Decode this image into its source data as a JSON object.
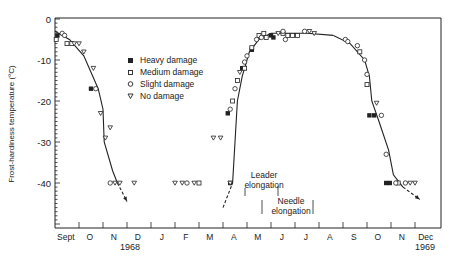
{
  "chart_data": {
    "type": "scatter",
    "title": "",
    "xlabel": "",
    "ylabel": "Frost-hardiness temperature (°C)",
    "ylim": [
      -50,
      0
    ],
    "yticks": [
      0,
      -10,
      -20,
      -30,
      -40
    ],
    "ytick_labels": [
      "0",
      "-10",
      "-20",
      "-30",
      "-40"
    ],
    "x_unit": "months from 1 Sept 1968",
    "xlim": [
      0,
      16
    ],
    "x_month_labels": [
      "Sept",
      "O",
      "N",
      "D",
      "J",
      "F",
      "M",
      "A",
      "M",
      "J",
      "J",
      "A",
      "S",
      "O",
      "N",
      "Dec"
    ],
    "year_labels": [
      {
        "text": "1968",
        "x": 3.5
      },
      {
        "text": "1969",
        "x": 4.5
      },
      {
        "text": "1969",
        "x": 15.5
      }
    ],
    "grid": false,
    "legend_position": "upper-left-inside",
    "legend": [
      {
        "label": "Heavy damage",
        "marker": "filled-square"
      },
      {
        "label": "Medium damage",
        "marker": "open-square"
      },
      {
        "label": "Slight damage",
        "marker": "open-circle"
      },
      {
        "label": "No damage",
        "marker": "open-triangle-down"
      }
    ],
    "series": [
      {
        "name": "Heavy damage",
        "marker": "filled-square",
        "points": [
          [
            0.1,
            -4
          ],
          [
            1.5,
            -17
          ],
          [
            7.2,
            -23
          ],
          [
            7.8,
            -12
          ],
          [
            8.2,
            -7.5
          ],
          [
            9.0,
            -4
          ],
          [
            9.1,
            -4.5
          ],
          [
            13.1,
            -23.5
          ],
          [
            13.3,
            -23.5
          ],
          [
            13.8,
            -40
          ],
          [
            13.95,
            -40
          ],
          [
            7.3,
            -40
          ]
        ]
      },
      {
        "name": "Medium damage",
        "marker": "open-square",
        "points": [
          [
            0.05,
            -5
          ],
          [
            0.5,
            -6
          ],
          [
            0.7,
            -6
          ],
          [
            7.4,
            -20
          ],
          [
            7.6,
            -15
          ],
          [
            7.9,
            -12
          ],
          [
            8.2,
            -7
          ],
          [
            8.5,
            -4
          ],
          [
            8.7,
            -3.5
          ],
          [
            8.8,
            -4.5
          ],
          [
            9.5,
            -3.5
          ],
          [
            9.7,
            -4
          ],
          [
            9.9,
            -4
          ],
          [
            10.1,
            -4
          ],
          [
            12.7,
            -8
          ],
          [
            13.0,
            -16
          ],
          [
            14.3,
            -40
          ],
          [
            6.0,
            -40
          ]
        ]
      },
      {
        "name": "Slight damage",
        "marker": "open-circle",
        "points": [
          [
            0.3,
            -3.5
          ],
          [
            0.4,
            -4
          ],
          [
            1.7,
            -17
          ],
          [
            7.3,
            -22
          ],
          [
            7.5,
            -17
          ],
          [
            7.9,
            -10.5
          ],
          [
            8.0,
            -9
          ],
          [
            8.4,
            -5
          ],
          [
            8.6,
            -4.5
          ],
          [
            9.5,
            -3
          ],
          [
            9.6,
            -5
          ],
          [
            10.4,
            -3
          ],
          [
            12.1,
            -5
          ],
          [
            12.2,
            -5.5
          ],
          [
            12.6,
            -6.5
          ],
          [
            12.9,
            -10
          ],
          [
            13.0,
            -13.5
          ],
          [
            13.6,
            -23.5
          ],
          [
            13.8,
            -33
          ],
          [
            14.2,
            -40
          ],
          [
            14.6,
            -40
          ],
          [
            2.3,
            -40
          ],
          [
            5.5,
            -40
          ]
        ]
      },
      {
        "name": "No damage",
        "marker": "open-triangle-down",
        "points": [
          [
            0.8,
            -6
          ],
          [
            1.0,
            -6
          ],
          [
            1.2,
            -8
          ],
          [
            1.6,
            -12
          ],
          [
            1.9,
            -23
          ],
          [
            2.1,
            -29
          ],
          [
            2.3,
            -26.5
          ],
          [
            2.5,
            -40
          ],
          [
            2.7,
            -40
          ],
          [
            3.3,
            -40
          ],
          [
            5.0,
            -40
          ],
          [
            5.3,
            -40
          ],
          [
            5.8,
            -40
          ],
          [
            6.6,
            -29
          ],
          [
            6.9,
            -29
          ],
          [
            7.3,
            -40
          ],
          [
            7.7,
            -13
          ],
          [
            9.3,
            -3.5
          ],
          [
            10.6,
            -3
          ],
          [
            10.8,
            -3.5
          ],
          [
            13.4,
            -20.5
          ],
          [
            14.8,
            -40
          ],
          [
            15.0,
            -40
          ]
        ]
      }
    ],
    "fitted_curves": [
      {
        "name": "1968 autumn hardening",
        "points": [
          [
            0,
            -3
          ],
          [
            0.6,
            -5
          ],
          [
            1.2,
            -9
          ],
          [
            1.8,
            -17
          ],
          [
            2.0,
            -22
          ],
          [
            2.05,
            -30
          ],
          [
            2.4,
            -37
          ],
          [
            2.6,
            -40
          ]
        ],
        "extension_dashed": [
          [
            2.6,
            -40
          ],
          [
            3.0,
            -44.5
          ]
        ]
      },
      {
        "name": "1969 spring dehardening",
        "points": [
          [
            7.4,
            -40
          ],
          [
            7.5,
            -30
          ],
          [
            7.6,
            -20
          ],
          [
            7.8,
            -14
          ],
          [
            8.1,
            -8
          ],
          [
            8.5,
            -5
          ],
          [
            9.0,
            -3.5
          ]
        ],
        "extension_dashed": [
          [
            7.0,
            -46
          ],
          [
            7.4,
            -40
          ]
        ]
      },
      {
        "name": "1969 summer plateau",
        "points": [
          [
            9.0,
            -3.5
          ],
          [
            10.5,
            -3.5
          ],
          [
            11.6,
            -4
          ]
        ]
      },
      {
        "name": "1969 autumn hardening",
        "points": [
          [
            11.6,
            -4
          ],
          [
            12.3,
            -6
          ],
          [
            12.9,
            -10
          ],
          [
            13.1,
            -14
          ],
          [
            13.2,
            -20
          ],
          [
            13.5,
            -25
          ],
          [
            13.9,
            -32
          ],
          [
            14.1,
            -38
          ],
          [
            14.5,
            -41
          ]
        ],
        "extension_dashed": [
          [
            14.5,
            -41
          ],
          [
            15.2,
            -44
          ]
        ]
      }
    ],
    "annotations": [
      {
        "text": "Leader elongation",
        "x_range": [
          8.0,
          9.8
        ],
        "y": -40
      },
      {
        "text": "Needle elongation",
        "x_range": [
          9.5,
          11.3
        ],
        "y": -44
      }
    ]
  },
  "axis": {
    "ylabel": "Frost-hardiness temperature (°C)",
    "yticks": [
      "0",
      "-10",
      "-20",
      "-30",
      "-40"
    ],
    "months": [
      "Sept",
      "O",
      "N",
      "D",
      "J",
      "F",
      "M",
      "A",
      "M",
      "J",
      "J",
      "A",
      "S",
      "O",
      "N",
      "Dec"
    ],
    "year_1968": "1968",
    "year_1969a": "1969",
    "year_1969b": "1969"
  },
  "legend": {
    "heavy": "Heavy damage",
    "medium": "Medium damage",
    "slight": "Slight damage",
    "none": "No damage"
  },
  "annotations": {
    "leader_line1": "Leader",
    "leader_line2": "elongation",
    "needle_line1": "Needle",
    "needle_line2": "elongation"
  },
  "colors": {
    "ink": "#222222",
    "background": "#ffffff"
  }
}
